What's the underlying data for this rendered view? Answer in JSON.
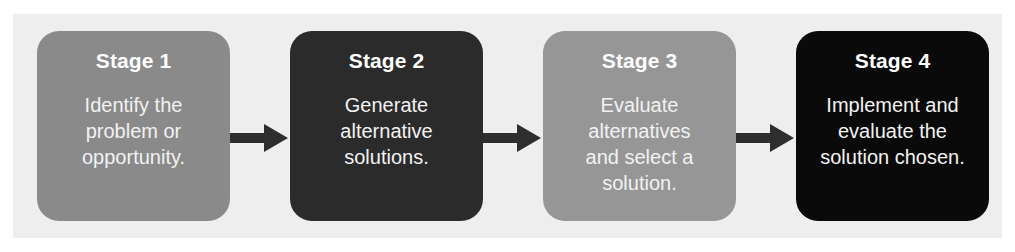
{
  "figure": {
    "cut_off_text_above": "",
    "frame_background": "#eeeeee",
    "page_background": "#ffffff"
  },
  "diagram": {
    "type": "linear-process-flow",
    "direction": "left-to-right",
    "arrow_color": "#2e2e2e",
    "stages": [
      {
        "title": "Stage 1",
        "description": "Identify the\nproblem or\nopportunity.",
        "fill_color": "#8a8a8a",
        "text_color": "#ffffff"
      },
      {
        "title": "Stage 2",
        "description": "Generate\nalternative\nsolutions.",
        "fill_color": "#2b2b2b",
        "text_color": "#ffffff"
      },
      {
        "title": "Stage 3",
        "description": "Evaluate\nalternatives\nand select a\nsolution.",
        "fill_color": "#969696",
        "text_color": "#ffffff"
      },
      {
        "title": "Stage 4",
        "description": "Implement and\nevaluate the\nsolution chosen.",
        "fill_color": "#0a0a0a",
        "text_color": "#ffffff"
      }
    ],
    "connectors": [
      {
        "name": "arrow-stage1-to-stage2"
      },
      {
        "name": "arrow-stage2-to-stage3"
      },
      {
        "name": "arrow-stage3-to-stage4"
      }
    ]
  }
}
